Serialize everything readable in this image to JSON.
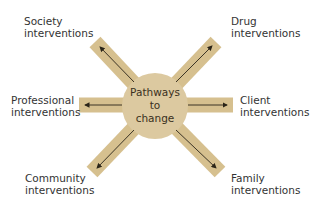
{
  "center": {
    "line1": "Pathways",
    "line2": "to",
    "line3": "change"
  },
  "nodes": [
    {
      "id": "society",
      "line1": "Society",
      "line2": "interventions"
    },
    {
      "id": "drug",
      "line1": "Drug",
      "line2": "interventions"
    },
    {
      "id": "professional",
      "line1": "Professional",
      "line2": "interventions"
    },
    {
      "id": "client",
      "line1": "Client",
      "line2": "interventions"
    },
    {
      "id": "community",
      "line1": "Community",
      "line2": "interventions"
    },
    {
      "id": "family",
      "line1": "Family",
      "line2": "interventions"
    }
  ],
  "colors": {
    "arm": "#d9c496",
    "arm_edge": "#c9b07a",
    "arrow": "#2a2418",
    "text": "#333333"
  }
}
